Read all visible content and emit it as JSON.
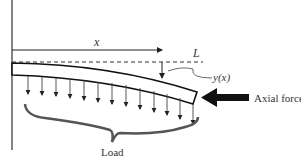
{
  "diagram": {
    "labels": {
      "x": "x",
      "L": "L",
      "y": "y(x)",
      "axial_force": "Axial force",
      "load": "Load"
    },
    "load_arrow_count": 13,
    "colors": {
      "line": "#222222",
      "brace": "#555555"
    }
  }
}
